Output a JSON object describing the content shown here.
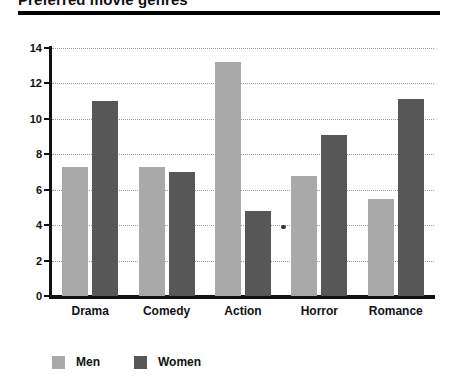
{
  "chart_data": {
    "type": "bar",
    "title": "Preferred movie genres",
    "xlabel": "",
    "ylabel": "",
    "categories": [
      "Drama",
      "Comedy",
      "Action",
      "Horror",
      "Romance"
    ],
    "series": [
      {
        "name": "Men",
        "color": "#a9a9a9",
        "values": [
          7.3,
          7.3,
          13.2,
          6.8,
          5.5
        ]
      },
      {
        "name": "Women",
        "color": "#575757",
        "values": [
          11.0,
          7.0,
          4.8,
          9.1,
          11.1
        ]
      }
    ],
    "ylim": [
      0,
      14
    ],
    "yticks": [
      0,
      2,
      4,
      6,
      8,
      10,
      12,
      14
    ],
    "ytick_labels": [
      "0",
      "2",
      "4",
      "6",
      "8",
      "10",
      "12",
      "14"
    ],
    "grid": true,
    "grid_style": "dotted",
    "legend_position": "bottom-left"
  },
  "legend": {
    "items": [
      {
        "label": "Men",
        "color": "#a9a9a9"
      },
      {
        "label": "Women",
        "color": "#575757"
      }
    ]
  }
}
